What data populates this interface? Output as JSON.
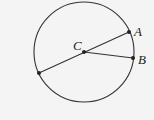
{
  "diagram": {
    "type": "circle-geometry",
    "labels": {
      "center": "C",
      "point_a": "A",
      "point_b": "B"
    },
    "colors": {
      "stroke": "#333333",
      "background": "#f4f4f4"
    }
  }
}
